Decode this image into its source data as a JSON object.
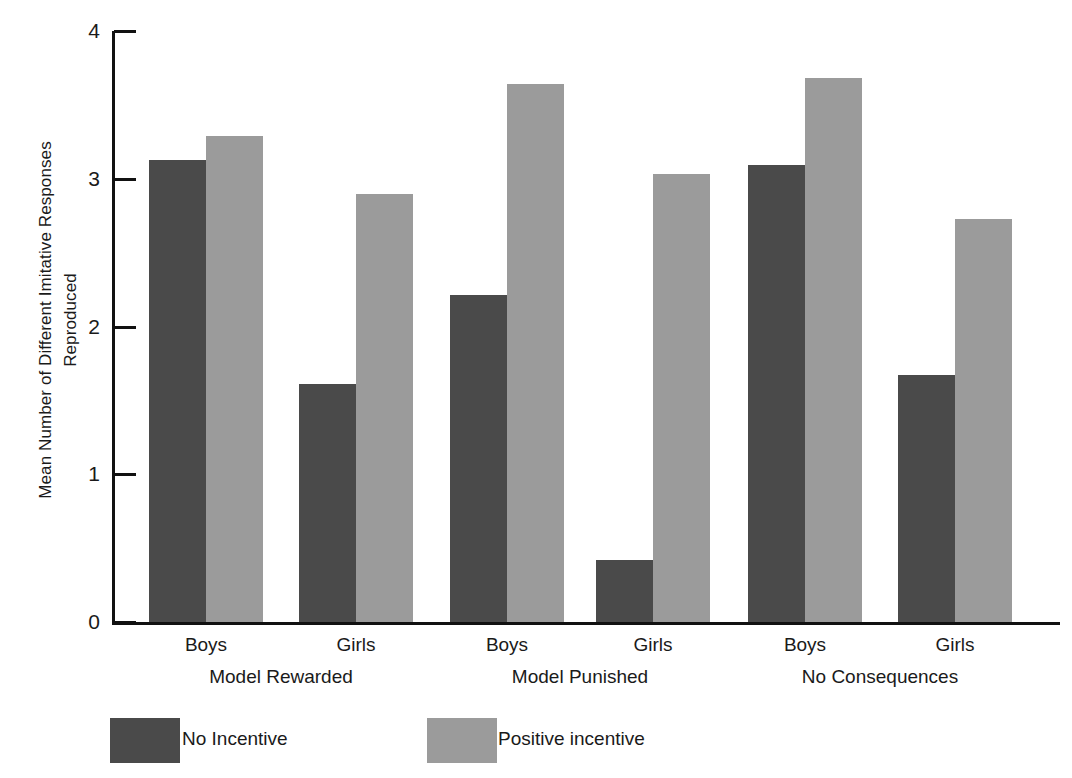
{
  "chart_data": {
    "type": "bar",
    "title": "",
    "xlabel": "",
    "ylabel": "Mean Number of Different Imitative Responses Reproduced",
    "ylabel_line1": "Mean Number of Different Imitative Responses",
    "ylabel_line2": "Reproduced",
    "ylim": [
      0,
      4
    ],
    "ytick_labels": [
      "0",
      "1",
      "2",
      "3",
      "4"
    ],
    "ytick_values": [
      0,
      1,
      2,
      3,
      4
    ],
    "grid": false,
    "legend_position": "bottom-left",
    "group_labels": [
      "Model Rewarded",
      "Model Punished",
      "No Consequences"
    ],
    "categories": [
      "Model Rewarded – Boys",
      "Model Rewarded – Girls",
      "Model Punished – Boys",
      "Model Punished – Girls",
      "No Consequences – Boys",
      "No Consequences – Girls"
    ],
    "subcategory_labels": [
      "Boys",
      "Girls",
      "Boys",
      "Girls",
      "Boys",
      "Girls"
    ],
    "series": [
      {
        "name": "No Incentive",
        "color": "#4a4a4a",
        "values": [
          3.13,
          1.61,
          2.21,
          0.42,
          3.09,
          1.67
        ]
      },
      {
        "name": "Positive incentive",
        "color": "#9b9b9b",
        "values": [
          3.29,
          2.9,
          3.64,
          3.03,
          3.68,
          2.73
        ]
      }
    ],
    "bars": [
      {
        "group": 0,
        "sub": "Boys",
        "series": "No Incentive",
        "value": 3.13,
        "x": 149,
        "w": 57,
        "color": "#4a4a4a"
      },
      {
        "group": 0,
        "sub": "Boys",
        "series": "Positive incentive",
        "value": 3.29,
        "x": 206,
        "w": 57,
        "color": "#9b9b9b"
      },
      {
        "group": 0,
        "sub": "Girls",
        "series": "No Incentive",
        "value": 1.61,
        "x": 299,
        "w": 57,
        "color": "#4a4a4a"
      },
      {
        "group": 0,
        "sub": "Girls",
        "series": "Positive incentive",
        "value": 2.9,
        "x": 356,
        "w": 57,
        "color": "#9b9b9b"
      },
      {
        "group": 1,
        "sub": "Boys",
        "series": "No Incentive",
        "value": 2.21,
        "x": 450,
        "w": 57,
        "color": "#4a4a4a"
      },
      {
        "group": 1,
        "sub": "Boys",
        "series": "Positive incentive",
        "value": 3.64,
        "x": 507,
        "w": 57,
        "color": "#9b9b9b"
      },
      {
        "group": 1,
        "sub": "Girls",
        "series": "No Incentive",
        "value": 0.42,
        "x": 596,
        "w": 57,
        "color": "#4a4a4a"
      },
      {
        "group": 1,
        "sub": "Girls",
        "series": "Positive incentive",
        "value": 3.03,
        "x": 653,
        "w": 57,
        "color": "#9b9b9b"
      },
      {
        "group": 2,
        "sub": "Boys",
        "series": "No Incentive",
        "value": 3.09,
        "x": 748,
        "w": 57,
        "color": "#4a4a4a"
      },
      {
        "group": 2,
        "sub": "Boys",
        "series": "Positive incentive",
        "value": 3.68,
        "x": 805,
        "w": 57,
        "color": "#9b9b9b"
      },
      {
        "group": 2,
        "sub": "Girls",
        "series": "No Incentive",
        "value": 1.67,
        "x": 898,
        "w": 57,
        "color": "#4a4a4a"
      },
      {
        "group": 2,
        "sub": "Girls",
        "series": "Positive incentive",
        "value": 2.73,
        "x": 955,
        "w": 57,
        "color": "#9b9b9b"
      }
    ]
  },
  "axis": {
    "ylabel_line1": "Mean Number of Different Imitative Responses",
    "ylabel_line2": "Reproduced",
    "ticks": [
      {
        "label": "4",
        "value": 4
      },
      {
        "label": "3",
        "value": 3
      },
      {
        "label": "2",
        "value": 2
      },
      {
        "label": "1",
        "value": 1
      },
      {
        "label": "0",
        "value": 0
      }
    ]
  },
  "xaxis": {
    "sub_labels": [
      {
        "text": "Boys",
        "center": 206
      },
      {
        "text": "Girls",
        "center": 356
      },
      {
        "text": "Boys",
        "center": 507
      },
      {
        "text": "Girls",
        "center": 653
      },
      {
        "text": "Boys",
        "center": 805
      },
      {
        "text": "Girls",
        "center": 955
      }
    ],
    "groups": [
      {
        "text": "Model Rewarded",
        "center": 281
      },
      {
        "text": "Model Punished",
        "center": 580
      },
      {
        "text": "No Consequences",
        "center": 880
      }
    ]
  },
  "legend": {
    "title": "Key:",
    "items": [
      {
        "label": "No Incentive",
        "color": "#4a4a4a",
        "swatch_x": 110,
        "text_x": 182
      },
      {
        "label": "Positive incentive",
        "color": "#9b9b9b",
        "swatch_x": 427,
        "text_x": 498
      }
    ]
  },
  "geometry": {
    "plot_left": 112,
    "plot_right": 1060,
    "baseline_y": 622,
    "top_y": 31,
    "px_per_unit": 147.75
  }
}
